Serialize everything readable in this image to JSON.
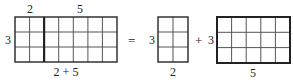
{
  "diagram": {
    "left_grid": {
      "rows": 3,
      "cols": 7,
      "split_col": 2,
      "top_labels": [
        "2",
        "5"
      ],
      "side_label": "3",
      "bottom_label": "2 + 5"
    },
    "equals": "=",
    "middle_grid": {
      "rows": 3,
      "cols": 2,
      "side_label": "3",
      "bottom_label": "2"
    },
    "plus": "+",
    "right_grid": {
      "rows": 3,
      "cols": 5,
      "side_label": "3",
      "bottom_label": "5"
    },
    "colors": {
      "line": "#333333",
      "thin_line": "#555555",
      "background": "#ffffff"
    }
  }
}
